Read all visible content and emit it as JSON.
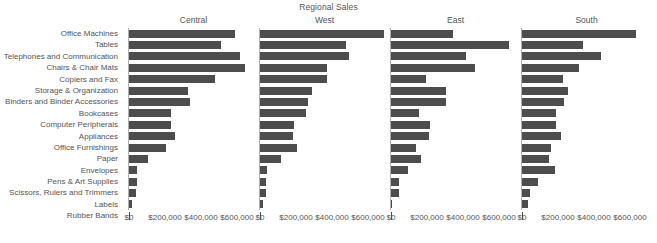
{
  "chart_data": {
    "type": "bar",
    "orientation": "horizontal",
    "title": "Regional Sales",
    "xlabel": "",
    "ylabel": "",
    "xlim": [
      0,
      700000
    ],
    "grid": false,
    "legend": "none",
    "panel_layout": "columns",
    "panel_names": [
      "Central",
      "West",
      "East",
      "South"
    ],
    "xticks": [
      0,
      200000,
      400000,
      600000
    ],
    "xtick_labels": [
      "$0",
      "$200,000",
      "$400,000",
      "$600,000"
    ],
    "categories": [
      "Office Machines",
      "Tables",
      "Telephones and Communication",
      "Chairs & Chair Mats",
      "Copiers and Fax",
      "Storage & Organization",
      "Binders and Binder Accessories",
      "Bookcases",
      "Computer Peripherals",
      "Appliances",
      "Office Furnishings",
      "Paper",
      "Envelopes",
      "Pens & Art Supplies",
      "Scissors, Rulers and Trimmers",
      "Labels",
      "Rubber Bands"
    ],
    "series": [
      {
        "name": "Central",
        "values": [
          587000,
          512000,
          618000,
          646000,
          475000,
          327000,
          339000,
          235000,
          231000,
          257000,
          207000,
          103000,
          42000,
          43000,
          39000,
          19000,
          4000
        ]
      },
      {
        "name": "West",
        "values": [
          690000,
          478000,
          492000,
          372000,
          370000,
          291000,
          268000,
          256000,
          189000,
          181000,
          205000,
          118000,
          37000,
          36000,
          31000,
          14000,
          3000
        ]
      },
      {
        "name": "East",
        "values": [
          344000,
          655000,
          417000,
          468000,
          192000,
          305000,
          306000,
          156000,
          218000,
          210000,
          139000,
          168000,
          94000,
          47000,
          44000,
          8000,
          4000
        ]
      },
      {
        "name": "South",
        "values": [
          632000,
          341000,
          441000,
          319000,
          229000,
          258000,
          236000,
          190000,
          190000,
          218000,
          160000,
          152000,
          182000,
          87000,
          43000,
          35000,
          7000
        ]
      }
    ],
    "colors": {
      "bar": "#4d4d4d",
      "axis": "#b0b0b0",
      "text": "#555555",
      "background": "#ffffff"
    }
  },
  "axis": {
    "tick_labels": [
      "$0",
      "$200,000",
      "$400,000",
      "$600,000"
    ]
  }
}
